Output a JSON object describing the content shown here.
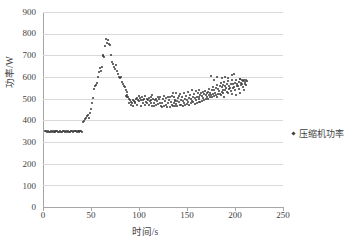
{
  "chart_data": {
    "type": "scatter",
    "title": "",
    "xlabel": "时间/s",
    "ylabel": "功率/W",
    "xlim": [
      0,
      250
    ],
    "ylim": [
      0,
      900
    ],
    "xticks": [
      0,
      50,
      100,
      150,
      200,
      250
    ],
    "yticks": [
      0,
      100,
      200,
      300,
      400,
      500,
      600,
      700,
      800,
      900
    ],
    "grid": "horizontal",
    "legend_position": "right",
    "marker_color": "#3a3a3a",
    "gridline_color": "#d9d9d9",
    "axis_color": "#a6a6a6",
    "series": [
      {
        "name": "压缩机功率",
        "marker": "dot",
        "points": [
          [
            2,
            352
          ],
          [
            3,
            349
          ],
          [
            4,
            346
          ],
          [
            5,
            351
          ],
          [
            6,
            348
          ],
          [
            7,
            345
          ],
          [
            8,
            350
          ],
          [
            9,
            347
          ],
          [
            10,
            352
          ],
          [
            11,
            346
          ],
          [
            12,
            349
          ],
          [
            13,
            344
          ],
          [
            14,
            350
          ],
          [
            15,
            353
          ],
          [
            16,
            347
          ],
          [
            17,
            345
          ],
          [
            18,
            350
          ],
          [
            19,
            348
          ],
          [
            20,
            346
          ],
          [
            21,
            351
          ],
          [
            22,
            349
          ],
          [
            23,
            345
          ],
          [
            24,
            352
          ],
          [
            25,
            347
          ],
          [
            26,
            350
          ],
          [
            27,
            346
          ],
          [
            28,
            348
          ],
          [
            29,
            352
          ],
          [
            30,
            350
          ],
          [
            31,
            347
          ],
          [
            32,
            349
          ],
          [
            33,
            353
          ],
          [
            34,
            351
          ],
          [
            35,
            348
          ],
          [
            36,
            350
          ],
          [
            37,
            346
          ],
          [
            38,
            352
          ],
          [
            39,
            349
          ],
          [
            40,
            351
          ],
          [
            41,
            348
          ],
          [
            42,
            392
          ],
          [
            43,
            398
          ],
          [
            44,
            405
          ],
          [
            45,
            412
          ],
          [
            46,
            418
          ],
          [
            47,
            425
          ],
          [
            48,
            410
          ],
          [
            49,
            435
          ],
          [
            50,
            452
          ],
          [
            51,
            480
          ],
          [
            52,
            505
          ],
          [
            53,
            545
          ],
          [
            54,
            558
          ],
          [
            55,
            565
          ],
          [
            56,
            572
          ],
          [
            57,
            600
          ],
          [
            58,
            622
          ],
          [
            59,
            640
          ],
          [
            60,
            630
          ],
          [
            61,
            648
          ],
          [
            62,
            695
          ],
          [
            63,
            700
          ],
          [
            64,
            692
          ],
          [
            65,
            742
          ],
          [
            66,
            775
          ],
          [
            67,
            758
          ],
          [
            68,
            770
          ],
          [
            69,
            752
          ],
          [
            70,
            748
          ],
          [
            71,
            700
          ],
          [
            72,
            668
          ],
          [
            73,
            660
          ],
          [
            74,
            645
          ],
          [
            75,
            638
          ],
          [
            76,
            655
          ],
          [
            77,
            628
          ],
          [
            78,
            612
          ],
          [
            79,
            600
          ],
          [
            80,
            596
          ],
          [
            81,
            602
          ],
          [
            82,
            578
          ],
          [
            83,
            566
          ],
          [
            84,
            558
          ],
          [
            85,
            552
          ],
          [
            86,
            540
          ],
          [
            87,
            530
          ],
          [
            88,
            518
          ],
          [
            89,
            508
          ],
          [
            90,
            500
          ],
          [
            91,
            492
          ],
          [
            92,
            486
          ],
          [
            93,
            482
          ],
          [
            94,
            495
          ],
          [
            95,
            490
          ],
          [
            96,
            486
          ],
          [
            97,
            498
          ],
          [
            98,
            502
          ],
          [
            99,
            494
          ],
          [
            100,
            488
          ],
          [
            101,
            502
          ],
          [
            102,
            496
          ],
          [
            103,
            508
          ],
          [
            104,
            492
          ],
          [
            105,
            500
          ],
          [
            106,
            512
          ],
          [
            107,
            486
          ],
          [
            108,
            480
          ],
          [
            109,
            496
          ],
          [
            110,
            505
          ],
          [
            111,
            488
          ],
          [
            112,
            478
          ],
          [
            113,
            495
          ],
          [
            114,
            518
          ],
          [
            115,
            500
          ],
          [
            116,
            482
          ],
          [
            117,
            492
          ],
          [
            118,
            470
          ],
          [
            119,
            488
          ],
          [
            120,
            506
          ],
          [
            121,
            498
          ],
          [
            122,
            478
          ],
          [
            123,
            465
          ],
          [
            124,
            482
          ],
          [
            125,
            498
          ],
          [
            126,
            512
          ],
          [
            127,
            488
          ],
          [
            128,
            472
          ],
          [
            129,
            460
          ],
          [
            130,
            478
          ],
          [
            131,
            492
          ],
          [
            132,
            506
          ],
          [
            133,
            486
          ],
          [
            134,
            470
          ],
          [
            135,
            465
          ],
          [
            136,
            482
          ],
          [
            137,
            496
          ],
          [
            138,
            488
          ],
          [
            139,
            475
          ],
          [
            140,
            490
          ],
          [
            141,
            502
          ],
          [
            142,
            484
          ],
          [
            143,
            472
          ],
          [
            144,
            496
          ],
          [
            145,
            508
          ],
          [
            146,
            490
          ],
          [
            147,
            478
          ],
          [
            148,
            500
          ],
          [
            149,
            512
          ],
          [
            150,
            494
          ],
          [
            151,
            486
          ],
          [
            152,
            502
          ],
          [
            153,
            516
          ],
          [
            154,
            498
          ],
          [
            155,
            488
          ],
          [
            156,
            506
          ],
          [
            157,
            520
          ],
          [
            158,
            502
          ],
          [
            159,
            492
          ],
          [
            160,
            510
          ],
          [
            161,
            524
          ],
          [
            162,
            506
          ],
          [
            163,
            498
          ],
          [
            164,
            516
          ],
          [
            165,
            528
          ],
          [
            166,
            512
          ],
          [
            167,
            502
          ],
          [
            168,
            520
          ],
          [
            169,
            534
          ],
          [
            170,
            516
          ],
          [
            171,
            508
          ],
          [
            172,
            530
          ],
          [
            173,
            545
          ],
          [
            174,
            528
          ],
          [
            175,
            516
          ],
          [
            176,
            540
          ],
          [
            177,
            556
          ],
          [
            178,
            538
          ],
          [
            179,
            528
          ],
          [
            180,
            550
          ],
          [
            181,
            565
          ],
          [
            182,
            546
          ],
          [
            183,
            536
          ],
          [
            184,
            558
          ],
          [
            185,
            572
          ],
          [
            186,
            552
          ],
          [
            187,
            542
          ],
          [
            188,
            562
          ],
          [
            189,
            578
          ],
          [
            190,
            558
          ],
          [
            191,
            548
          ],
          [
            192,
            566
          ],
          [
            193,
            580
          ],
          [
            194,
            560
          ],
          [
            195,
            550
          ],
          [
            196,
            570
          ],
          [
            197,
            585
          ],
          [
            198,
            566
          ],
          [
            199,
            556
          ],
          [
            200,
            574
          ],
          [
            201,
            588
          ],
          [
            202,
            570
          ],
          [
            203,
            560
          ],
          [
            204,
            578
          ],
          [
            205,
            590
          ],
          [
            206,
            574
          ],
          [
            207,
            566
          ],
          [
            208,
            580
          ],
          [
            209,
            586
          ],
          [
            210,
            578
          ],
          [
            211,
            584
          ],
          [
            212,
            580
          ],
          [
            88,
            508
          ],
          [
            92,
            472
          ],
          [
            96,
            478
          ],
          [
            100,
            512
          ],
          [
            104,
            478
          ],
          [
            108,
            500
          ],
          [
            112,
            508
          ],
          [
            116,
            466
          ],
          [
            120,
            474
          ],
          [
            124,
            462
          ],
          [
            128,
            502
          ],
          [
            132,
            462
          ],
          [
            136,
            506
          ],
          [
            140,
            466
          ],
          [
            144,
            470
          ],
          [
            148,
            470
          ],
          [
            152,
            470
          ],
          [
            156,
            486
          ],
          [
            160,
            482
          ],
          [
            164,
            486
          ],
          [
            168,
            492
          ],
          [
            172,
            500
          ],
          [
            176,
            506
          ],
          [
            180,
            518
          ],
          [
            184,
            520
          ],
          [
            188,
            528
          ],
          [
            192,
            530
          ],
          [
            196,
            534
          ],
          [
            200,
            540
          ],
          [
            204,
            546
          ],
          [
            208,
            556
          ],
          [
            211,
            564
          ],
          [
            86,
            512
          ],
          [
            90,
            482
          ],
          [
            94,
            466
          ],
          [
            98,
            470
          ],
          [
            102,
            468
          ],
          [
            106,
            470
          ],
          [
            110,
            470
          ],
          [
            114,
            468
          ],
          [
            118,
            500
          ],
          [
            122,
            510
          ],
          [
            126,
            468
          ],
          [
            130,
            506
          ],
          [
            134,
            512
          ],
          [
            138,
            464
          ],
          [
            142,
            512
          ],
          [
            146,
            466
          ],
          [
            150,
            474
          ],
          [
            154,
            478
          ],
          [
            158,
            474
          ],
          [
            162,
            486
          ],
          [
            166,
            490
          ],
          [
            170,
            498
          ],
          [
            174,
            506
          ],
          [
            178,
            514
          ],
          [
            182,
            522
          ],
          [
            186,
            532
          ],
          [
            190,
            538
          ],
          [
            194,
            544
          ],
          [
            198,
            550
          ],
          [
            202,
            558
          ],
          [
            206,
            562
          ],
          [
            210,
            570
          ],
          [
            175,
            604
          ],
          [
            181,
            600
          ],
          [
            190,
            600
          ],
          [
            197,
            608
          ],
          [
            199,
            612
          ],
          [
            186,
            594
          ],
          [
            178,
            586
          ],
          [
            193,
            596
          ],
          [
            205,
            592
          ],
          [
            207,
            586
          ],
          [
            163,
            540
          ],
          [
            167,
            532
          ],
          [
            171,
            524
          ],
          [
            159,
            534
          ],
          [
            155,
            540
          ],
          [
            151,
            532
          ],
          [
            147,
            528
          ],
          [
            143,
            522
          ],
          [
            139,
            528
          ],
          [
            135,
            524
          ],
          [
            173,
            516
          ],
          [
            177,
            522
          ],
          [
            181,
            510
          ],
          [
            185,
            518
          ],
          [
            189,
            506
          ],
          [
            193,
            524
          ],
          [
            197,
            520
          ],
          [
            201,
            516
          ],
          [
            205,
            528
          ],
          [
            209,
            540
          ]
        ]
      }
    ]
  },
  "axes": {
    "y_labels": [
      "900",
      "800",
      "700",
      "600",
      "500",
      "400",
      "300",
      "200",
      "100",
      "0"
    ],
    "x_labels": [
      "0",
      "50",
      "100",
      "150",
      "200",
      "250"
    ]
  },
  "legend": {
    "entries": [
      {
        "label": "压缩机功率"
      }
    ]
  }
}
